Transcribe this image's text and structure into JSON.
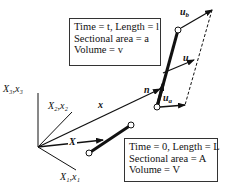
{
  "diagram": {
    "axes": {
      "x3_label": "X₃,x₃",
      "x2_label": "X₂,x₂",
      "x1_label": "X₁,x₁"
    },
    "vectors": {
      "x_label": "x",
      "X_label": "X",
      "n_label": "n",
      "u_label": "u",
      "ua_label": "u",
      "ua_sub": "a",
      "ub_label": "u",
      "ub_sub": "b"
    },
    "current_config_box": {
      "line1": "Time = t, Length = l",
      "line2": "Sectional area = a",
      "line3": "Volume = v"
    },
    "reference_config_box": {
      "line1": "Time = 0, Length = L",
      "line2": "Sectional area = A",
      "line3": "Volume = V"
    },
    "colors": {
      "line": "#111111",
      "background": "#ffffff"
    }
  }
}
